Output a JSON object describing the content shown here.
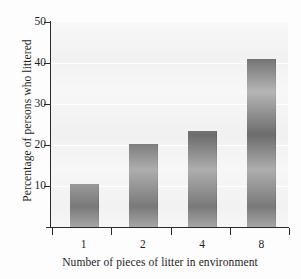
{
  "chart_data": {
    "type": "bar",
    "title": "",
    "xlabel": "Number of pieces of litter in environment",
    "ylabel": "Percentage of persons who littered",
    "categories": [
      "1",
      "2",
      "4",
      "8"
    ],
    "values": [
      10.5,
      20.3,
      23.5,
      41.0
    ],
    "ylim": [
      0,
      50
    ],
    "yticks": [
      10,
      20,
      30,
      40,
      50
    ],
    "ytick_labels": [
      "10",
      "20",
      "30",
      "40",
      "50"
    ],
    "grid": true,
    "grid_color": "#ffffff",
    "legend": "none",
    "bar_color": "#5c5c5c",
    "plot_background": "#efefef",
    "axis_color": "#2b2b2b"
  },
  "axes": {
    "y_title": "Percentage of persons who littered",
    "x_title": "Number of pieces of litter in environment",
    "y_ticks": [
      {
        "label": "50",
        "value": 50
      },
      {
        "label": "40",
        "value": 40
      },
      {
        "label": "30",
        "value": 30
      },
      {
        "label": "20",
        "value": 20
      },
      {
        "label": "10",
        "value": 10
      }
    ],
    "x_ticks": [
      {
        "label": "1",
        "value": 10.5
      },
      {
        "label": "2",
        "value": 20.3
      },
      {
        "label": "4",
        "value": 23.5
      },
      {
        "label": "8",
        "value": 41.0
      }
    ]
  }
}
